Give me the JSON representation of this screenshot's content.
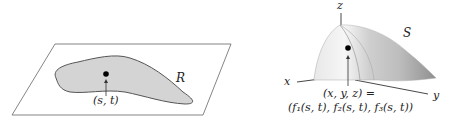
{
  "left_panel": {
    "region_label": "R",
    "point_label": "(s, t)"
  },
  "right_panel": {
    "axis_x": "x",
    "axis_y": "y",
    "axis_z": "z",
    "surface_label": "S",
    "point_line1": "(x, y, z) =",
    "point_line2": "(f₁(s, t), f₂(s, t), f₃(s, t))"
  },
  "colors": {
    "region_fill": "#d6d6d6",
    "outline": "#555555",
    "surface_light": "#f2f2f2",
    "surface_dark": "#9a9a9a"
  }
}
